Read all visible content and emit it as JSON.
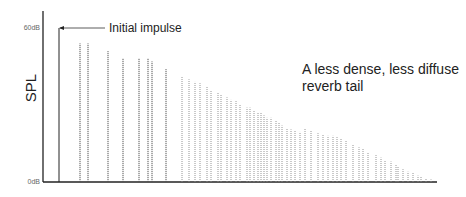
{
  "chart_data": {
    "type": "bar",
    "title": "",
    "xlabel": "",
    "ylabel": "SPL",
    "ylim": [
      0,
      60
    ],
    "y_ticks": [
      "0dB",
      "60dB"
    ],
    "grid": false,
    "legend": null,
    "annotations": [
      {
        "text": "Initial impulse",
        "points_to": "initial impulse (first line)"
      },
      {
        "text": "A less dense, less diffuse",
        "line": 1
      },
      {
        "text": "reverb tail",
        "line": 2
      }
    ],
    "series": [
      {
        "name": "initial impulse",
        "style": "solid",
        "x": [
          59
        ],
        "values": [
          60
        ]
      },
      {
        "name": "early reflections",
        "style": "dotted",
        "x": [
          80,
          88,
          108,
          123,
          139,
          148,
          152,
          166
        ],
        "values": [
          54,
          54,
          51,
          48,
          48,
          48,
          47,
          44
        ]
      },
      {
        "name": "reverb tail",
        "style": "dotted-light",
        "x": [
          182,
          189,
          195,
          200,
          207,
          211,
          218,
          221,
          227,
          231,
          236,
          240,
          247,
          250,
          254,
          258,
          261,
          264,
          267,
          271,
          276,
          279,
          282,
          287,
          291,
          295,
          300,
          305,
          311,
          318,
          323,
          328,
          333,
          337,
          341,
          346,
          353,
          359,
          363,
          368,
          376,
          381,
          385,
          391,
          396,
          398,
          403,
          408,
          413,
          418,
          421,
          426,
          431
        ],
        "values": [
          41,
          40,
          39,
          38.5,
          37,
          35.5,
          35,
          34,
          33,
          32,
          31.5,
          30,
          29,
          29,
          28,
          27,
          27,
          26,
          25,
          25,
          24,
          23,
          22,
          21,
          20.5,
          20,
          19.5,
          21,
          20,
          19,
          18.5,
          18,
          18,
          17.5,
          17,
          16,
          14.5,
          13.5,
          13,
          11.5,
          10.5,
          9.5,
          8.5,
          8,
          7,
          6,
          5,
          4,
          3.5,
          2.5,
          2,
          1.5,
          1
        ]
      }
    ]
  },
  "axes": {
    "ylabel": "SPL",
    "y_top_label": "60dB",
    "y_bottom_label": "0dB"
  },
  "annotations": {
    "initial_impulse": "Initial impulse",
    "tail_line1": "A less dense, less diffuse",
    "tail_line2": "reverb tail"
  }
}
